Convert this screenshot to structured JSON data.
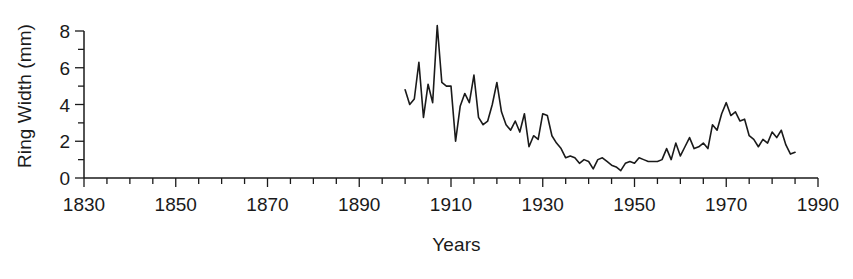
{
  "chart_data": {
    "type": "line",
    "title": "",
    "xlabel": "Years",
    "ylabel": "Ring Width (mm)",
    "xlim": [
      1830,
      1990
    ],
    "ylim": [
      0,
      8
    ],
    "grid": false,
    "legend": "none",
    "x_major_ticks": [
      1830,
      1850,
      1870,
      1890,
      1910,
      1930,
      1950,
      1970,
      1990
    ],
    "x_tick_labels": [
      "1830",
      "1850",
      "1870",
      "1890",
      "1910",
      "1930",
      "1950",
      "1970",
      "1990"
    ],
    "x_minor_tick_step": 5,
    "y_major_ticks": [
      0,
      2,
      4,
      6,
      8
    ],
    "y_tick_labels": [
      "0",
      "2",
      "4",
      "6",
      "8"
    ],
    "y_minor_tick_step": 1,
    "series_name": "Ring Width",
    "line_color": "#1a1a1a",
    "line_width": 1.6,
    "x": [
      1900,
      1901,
      1902,
      1903,
      1904,
      1905,
      1906,
      1907,
      1908,
      1909,
      1910,
      1911,
      1912,
      1913,
      1914,
      1915,
      1916,
      1917,
      1918,
      1919,
      1920,
      1921,
      1922,
      1923,
      1924,
      1925,
      1926,
      1927,
      1928,
      1929,
      1930,
      1931,
      1932,
      1933,
      1934,
      1935,
      1936,
      1937,
      1938,
      1939,
      1940,
      1941,
      1942,
      1943,
      1944,
      1945,
      1946,
      1947,
      1948,
      1949,
      1950,
      1951,
      1952,
      1953,
      1954,
      1955,
      1956,
      1957,
      1958,
      1959,
      1960,
      1961,
      1962,
      1963,
      1964,
      1965,
      1966,
      1967,
      1968,
      1969,
      1970,
      1971,
      1972,
      1973,
      1974,
      1975,
      1976,
      1977,
      1978,
      1979,
      1980,
      1981,
      1982,
      1983,
      1984,
      1985
    ],
    "y": [
      4.8,
      4.0,
      4.3,
      6.3,
      3.3,
      5.1,
      4.1,
      8.3,
      5.2,
      5.0,
      5.0,
      2.0,
      3.9,
      4.6,
      4.1,
      5.6,
      3.3,
      2.9,
      3.1,
      4.0,
      5.2,
      3.6,
      2.9,
      2.6,
      3.1,
      2.5,
      3.5,
      1.7,
      2.3,
      2.1,
      3.5,
      3.4,
      2.3,
      1.9,
      1.6,
      1.1,
      1.2,
      1.1,
      0.8,
      1.0,
      0.9,
      0.5,
      1.0,
      1.1,
      0.9,
      0.7,
      0.6,
      0.4,
      0.8,
      0.9,
      0.8,
      1.1,
      1.0,
      0.9,
      0.9,
      0.9,
      1.0,
      1.6,
      1.0,
      1.9,
      1.2,
      1.7,
      2.2,
      1.6,
      1.7,
      1.9,
      1.6,
      2.9,
      2.6,
      3.5,
      4.1,
      3.4,
      3.6,
      3.1,
      3.2,
      2.3,
      2.1,
      1.7,
      2.1,
      1.9,
      2.5,
      2.2,
      2.6,
      1.8,
      1.3,
      1.4
    ]
  },
  "axes": {
    "x_title": "Years",
    "y_title": "Ring Width (mm)"
  }
}
